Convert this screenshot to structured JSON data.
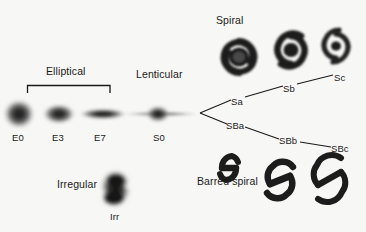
{
  "figure": {
    "name": "hubble-tuning-fork",
    "background_color": "#f7f7f5",
    "ink_color": "#1a1a1a"
  },
  "groups": {
    "elliptical": "Elliptical",
    "lenticular": "Lenticular",
    "spiral": "Spiral",
    "barred_spiral": "Barred spiral",
    "irregular": "Irregular"
  },
  "ellipticals": [
    {
      "label": "E0",
      "x": 18,
      "y": 131
    },
    {
      "label": "E3",
      "x": 58,
      "y": 131
    },
    {
      "label": "E7",
      "x": 100,
      "y": 131
    }
  ],
  "lenticular": {
    "label": "S0",
    "x": 159,
    "y": 131
  },
  "spiral_branch": [
    {
      "label": "Sa",
      "x": 237,
      "y": 103
    },
    {
      "label": "Sb",
      "x": 288,
      "y": 90
    },
    {
      "label": "Sc",
      "x": 339,
      "y": 79
    }
  ],
  "barred_branch": [
    {
      "label": "SBa",
      "x": 232,
      "y": 127
    },
    {
      "label": "SBb",
      "x": 284,
      "y": 142
    },
    {
      "label": "SBc",
      "x": 336,
      "y": 150
    }
  ],
  "irregular": {
    "label": "Irr",
    "x": 115,
    "y": 216
  },
  "group_label_positions": {
    "elliptical": {
      "x": 46,
      "y": 72
    },
    "lenticular": {
      "x": 136,
      "y": 75
    },
    "spiral": {
      "x": 216,
      "y": 21
    },
    "barred_spiral": {
      "x": 197,
      "y": 182
    },
    "irregular": {
      "x": 57,
      "y": 185
    }
  }
}
